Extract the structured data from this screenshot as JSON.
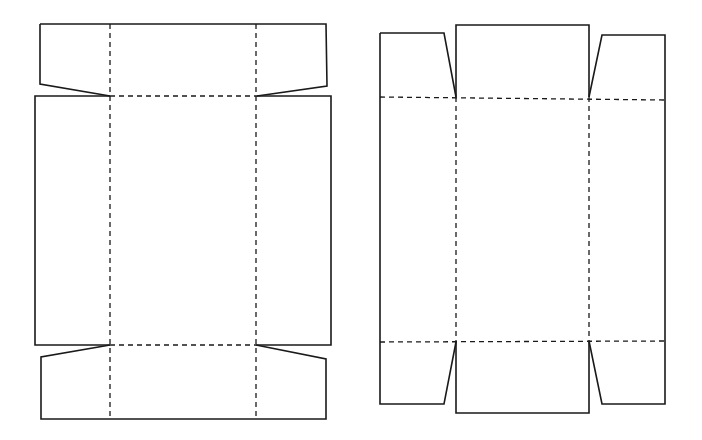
{
  "diagram": {
    "type": "box-net-dielines",
    "colors": {
      "line": "#1a1a1a",
      "background": "#ffffff"
    },
    "legend": {
      "solid_line": "cut line",
      "dashed_line": "fold line"
    },
    "nets": [
      {
        "id": "left-net",
        "description": "Tray net with trapezoid end flaps on top and bottom",
        "cut_paths": [
          "M40,24 L326,24 L327,86 L257,96",
          "M40,24 L40,84 L110,96",
          "M110,96 L35,96 L35,345 L110,345",
          "M256,96 L331,96 L331,345 L256,345",
          "M110,345 L41,357 L41,419 L326,419 L326,359 L256,345"
        ],
        "fold_paths": [
          "M110,24 L110,419",
          "M256,24 L256,419",
          "M110,96 L256,96",
          "M110,345 L256,345"
        ]
      },
      {
        "id": "right-net",
        "description": "Tray net with end panels and tapered side flaps",
        "cut_paths": [
          "M380,33 L444,33 L456,97",
          "M456,97 L456,25 L589,25 L589,97",
          "M589,97 L602,35 L665,35 L665,100",
          "M380,33 L380,404 L444,404 L456,342",
          "M456,342 L456,413 L589,413 L589,341",
          "M589,341 L602,404 L665,404 L665,341",
          "M665,100 L665,341"
        ],
        "fold_paths": [
          "M380,97 L665,100",
          "M380,342 L665,341",
          "M456,97 L456,342",
          "M589,97 L589,341"
        ]
      }
    ]
  }
}
